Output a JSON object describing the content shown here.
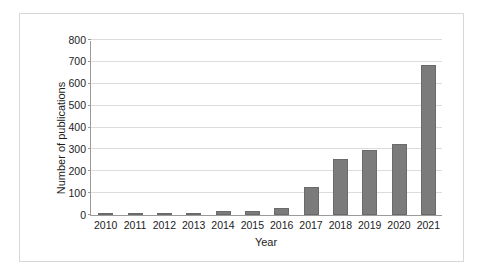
{
  "chart_data": {
    "type": "bar",
    "title": "",
    "subtitle": "",
    "xlabel": "Year",
    "ylabel": "Number of publications",
    "categories": [
      "2010",
      "2011",
      "2012",
      "2013",
      "2014",
      "2015",
      "2016",
      "2017",
      "2018",
      "2019",
      "2020",
      "2021"
    ],
    "values": [
      1,
      6,
      6,
      8,
      18,
      20,
      33,
      130,
      255,
      298,
      325,
      687
    ],
    "series": [
      {
        "name": "Number of publications",
        "values": [
          1,
          6,
          6,
          8,
          18,
          20,
          33,
          130,
          255,
          298,
          325,
          687
        ]
      }
    ],
    "ylim": [
      0,
      800
    ],
    "yticks": [
      0,
      100,
      200,
      300,
      400,
      500,
      600,
      700,
      800
    ],
    "ytick_labels": [
      "0",
      "100",
      "200",
      "300",
      "400",
      "500",
      "600",
      "700",
      "800"
    ],
    "grid": "horizontal",
    "legend": "none",
    "bar_color": "#7b7b7b",
    "bar_edge_color": "#6a6a6a",
    "gridline_color": "#dcdcdc",
    "axis_color": "#9a9a9a",
    "frame_color": "#d8d8d8",
    "background_color": "#ffffff",
    "text_color": "#1c1c1c"
  }
}
